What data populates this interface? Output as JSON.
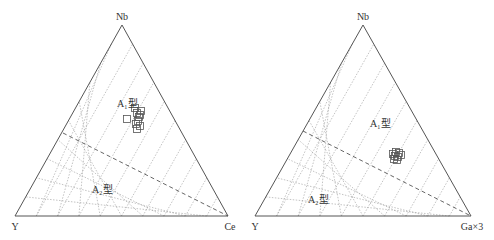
{
  "chart_data": [
    {
      "type": "ternary",
      "title": "",
      "vertices": {
        "top": "Nb",
        "left": "Y",
        "right": "Ce"
      },
      "grid": {
        "on": true,
        "divisions": 10,
        "style": "dotted",
        "directions": [
          "parallel-left-edge",
          "parallel-right-edge"
        ]
      },
      "boundary": {
        "style": "dashed",
        "from_left_edge_fraction_of_Nb": 0.44,
        "to": "Ce vertex"
      },
      "regions": [
        {
          "label_main": "A",
          "label_sub": "1",
          "label_suffix": "型",
          "position": "upper"
        },
        {
          "label_main": "A",
          "label_sub": "2",
          "label_suffix": "型",
          "position": "lower"
        }
      ],
      "points_marker": "open-square",
      "points_approx_xy_px": [
        [
          127,
          119
        ],
        [
          135,
          108
        ],
        [
          137,
          113
        ],
        [
          140,
          115
        ],
        [
          139,
          117
        ],
        [
          141,
          111
        ],
        [
          138,
          121
        ],
        [
          140,
          126
        ],
        [
          137,
          129
        ],
        [
          136,
          124
        ]
      ]
    },
    {
      "type": "ternary",
      "title": "",
      "vertices": {
        "top": "Nb",
        "left": "Y",
        "right": "Ga×3"
      },
      "grid": {
        "on": true,
        "divisions": 10,
        "style": "dotted",
        "directions": [
          "parallel-left-edge",
          "parallel-right-edge"
        ]
      },
      "boundary": {
        "style": "dashed",
        "from_left_edge_fraction_of_Nb": 0.45,
        "to": "Ga×3 vertex"
      },
      "regions": [
        {
          "label_main": "A",
          "label_sub": "1",
          "label_suffix": "型",
          "position": "upper"
        },
        {
          "label_main": "A",
          "label_sub": "2",
          "label_suffix": "型",
          "position": "lower"
        }
      ],
      "points_marker": "open-square",
      "points_approx_xy_px": [
        [
          393,
          154
        ],
        [
          396,
          152
        ],
        [
          399,
          153
        ],
        [
          398,
          157
        ],
        [
          394,
          159
        ],
        [
          397,
          160
        ],
        [
          401,
          155
        ],
        [
          395,
          156
        ]
      ]
    }
  ],
  "labels": {
    "left": {
      "top": "Nb",
      "left": "Y",
      "right": "Ce",
      "a1": "A",
      "a1_sub": "1",
      "a2": "A",
      "a2_sub": "2",
      "suffix": "型"
    },
    "right": {
      "top": "Nb",
      "left": "Y",
      "right": "Ga×3",
      "a1": "A",
      "a1_sub": "1",
      "a2": "A",
      "a2_sub": "2",
      "suffix": "型"
    }
  }
}
